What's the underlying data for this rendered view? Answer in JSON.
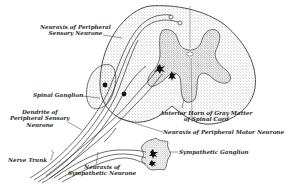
{
  "figure": {
    "colors": {
      "ink": "#2a2a2a",
      "stipple": "#8a8a8a",
      "background": "#ffffff"
    }
  },
  "labels": {
    "neuraxis_sensory_1": "Neuraxis of Peripheral",
    "neuraxis_sensory_2": "Sensory Neurone",
    "spinal_ganglion": "Spinal Ganglion",
    "dendrite_1": "Dendrite of",
    "dendrite_2": "Peripheral Sensory",
    "dendrite_3": "Neurone",
    "anterior_horn_1": "Anterior Horn of Gray Matter",
    "anterior_horn_2": "of Spinal Cord",
    "neuraxis_motor": "Neuraxis of Peripheral Motor Neurone",
    "sympathetic_ganglion": "Sympathetic Ganglion",
    "nerve_trunk": "Nerve Trunk",
    "neuraxis_sympathetic_1": "Neuraxis of",
    "neuraxis_sympathetic_2": "Sympathetic Neurone"
  }
}
